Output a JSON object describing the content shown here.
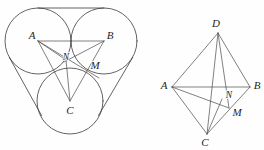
{
  "figure": {
    "background_color": "#fefefe",
    "stroke_color": "#3b3b3b",
    "label_color": "#1f1f1f",
    "width": 264,
    "height": 150
  },
  "left_figure": {
    "name": "three-tangent-circles-with-triangle",
    "description": "Three mutually tangent equal circles enclosed by a curved-sided region, with triangle ABC joining the centers and cevians meeting at N",
    "circles": [
      {
        "id": "circle-A",
        "cx": 38,
        "cy": 41,
        "r": 33
      },
      {
        "id": "circle-B",
        "cx": 104,
        "cy": 41,
        "r": 33
      },
      {
        "id": "circle-C",
        "cx": 70,
        "cy": 101,
        "r": 33
      }
    ],
    "tangent_lines": [
      {
        "id": "tangent-top",
        "x1": 38,
        "y1": 8,
        "x2": 104,
        "y2": 8
      },
      {
        "id": "tangent-left",
        "x1": 9,
        "y1": 57,
        "x2": 42,
        "y2": 117
      },
      {
        "id": "tangent-right",
        "x1": 133,
        "y1": 57,
        "x2": 99,
        "y2": 117
      }
    ],
    "triangle": {
      "vertices": [
        {
          "label": "A",
          "x": 38,
          "y": 41,
          "label_x": 32,
          "label_y": 36
        },
        {
          "label": "B",
          "x": 104,
          "y": 41,
          "label_x": 110,
          "label_y": 36
        },
        {
          "label": "C",
          "x": 70,
          "y": 101,
          "label_x": 70,
          "label_y": 110
        }
      ]
    },
    "interior_points": [
      {
        "label": "N",
        "x": 66,
        "y": 60,
        "label_x": 66,
        "label_y": 58
      },
      {
        "label": "M",
        "x": 87,
        "y": 71,
        "label_x": 95,
        "label_y": 66
      }
    ],
    "cevians": [
      {
        "id": "cevian-A-to-M",
        "from": "A",
        "to": "M"
      },
      {
        "id": "cevian-B-to-C",
        "from": "B",
        "to": "C"
      },
      {
        "id": "cevian-A-to-C",
        "from": "A",
        "to": "C"
      },
      {
        "id": "cevian-B-to-N",
        "from": "B",
        "to": "N"
      }
    ]
  },
  "right_figure": {
    "name": "tetrahedron-ABCD",
    "description": "Tetrahedron A B C D with interior point N on segment and point M on edge BC",
    "vertices": [
      {
        "label": "D",
        "x": 218,
        "y": 33,
        "label_x": 216,
        "label_y": 24
      },
      {
        "label": "A",
        "x": 172,
        "y": 87,
        "label_x": 164,
        "label_y": 85
      },
      {
        "label": "B",
        "x": 250,
        "y": 87,
        "label_x": 257,
        "label_y": 85
      },
      {
        "label": "C",
        "x": 207,
        "y": 134,
        "label_x": 205,
        "label_y": 142
      }
    ],
    "interior_points": [
      {
        "label": "N",
        "x": 222,
        "y": 100,
        "label_x": 228,
        "label_y": 96
      },
      {
        "label": "M",
        "x": 229,
        "y": 108,
        "label_x": 236,
        "label_y": 112
      }
    ],
    "edges": [
      {
        "id": "edge-D-A",
        "from": "D",
        "to": "A"
      },
      {
        "id": "edge-D-B",
        "from": "D",
        "to": "B"
      },
      {
        "id": "edge-D-C",
        "from": "D",
        "to": "C"
      },
      {
        "id": "edge-A-B",
        "from": "A",
        "to": "B"
      },
      {
        "id": "edge-A-C",
        "from": "A",
        "to": "C"
      },
      {
        "id": "edge-B-C",
        "from": "B",
        "to": "C"
      }
    ],
    "cevians": [
      {
        "id": "cevian-D-to-M",
        "from": "D",
        "to": "M"
      },
      {
        "id": "cevian-A-to-M",
        "from": "A",
        "to": "M"
      },
      {
        "id": "cevian-C-to-N",
        "from": "C",
        "to": "N"
      }
    ]
  },
  "labels": {
    "left_A": "A",
    "left_B": "B",
    "left_C": "C",
    "left_M": "M",
    "left_N": "N",
    "right_A": "A",
    "right_B": "B",
    "right_C": "C",
    "right_D": "D",
    "right_M": "M",
    "right_N": "N"
  }
}
